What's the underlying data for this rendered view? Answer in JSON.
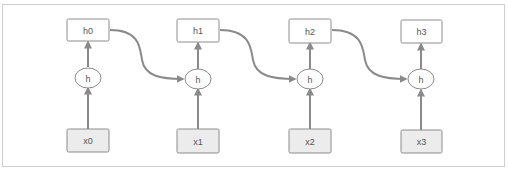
{
  "diagram": {
    "type": "unrolled-rnn",
    "colors": {
      "frame_border": "#cfcfcf",
      "box_border": "#8c8c8c",
      "output_fill": "#ffffff",
      "input_fill": "#ececec",
      "arrow": "#8a8a8a",
      "text": "#555555"
    },
    "steps": [
      {
        "output": "h0",
        "cell": "h",
        "input": "x0"
      },
      {
        "output": "h1",
        "cell": "h",
        "input": "x1"
      },
      {
        "output": "h2",
        "cell": "h",
        "input": "x2"
      },
      {
        "output": "h3",
        "cell": "h",
        "input": "x3"
      }
    ]
  }
}
